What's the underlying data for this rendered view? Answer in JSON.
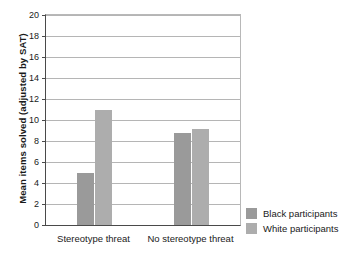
{
  "chart_data": {
    "type": "bar",
    "title": "",
    "xlabel": "",
    "ylabel": "Mean items solved (adjusted by SAT)",
    "categories": [
      "Stereotype threat",
      "No stereotype threat"
    ],
    "series": [
      {
        "name": "Black participants",
        "color": "#9a9a9a",
        "values": [
          5,
          8.8
        ]
      },
      {
        "name": "White participants",
        "color": "#adadad",
        "values": [
          11,
          9.1
        ]
      }
    ],
    "ylim": [
      0,
      20
    ],
    "ytick_step": 2,
    "yticks": [
      0,
      2,
      4,
      6,
      8,
      10,
      12,
      14,
      16,
      18,
      20
    ],
    "ytick_labels": [
      "0",
      "2",
      "4",
      "6",
      "8",
      "10",
      "12",
      "14",
      "16",
      "18",
      "20"
    ],
    "grid": true,
    "grid_axis": "y",
    "legend_position": "bottom-right-outside"
  }
}
